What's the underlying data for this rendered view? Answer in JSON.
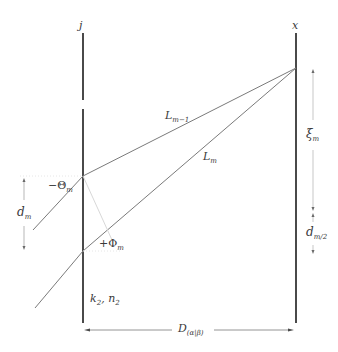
{
  "diagram": {
    "colors": {
      "boundary": "#4a4a4a",
      "ray": "#7a7a7a",
      "dimension": "#9a9a9a",
      "text": "#3a3a3a"
    },
    "boundaries": {
      "left": {
        "label": "j",
        "x": 83
      },
      "right": {
        "label": "x",
        "x": 296
      }
    },
    "rays": [
      {
        "label_main": "L",
        "label_sub": "m−1"
      },
      {
        "label_main": "L",
        "label_sub": "m"
      }
    ],
    "angles": {
      "theta": {
        "main": "−Θ",
        "sub": "m"
      },
      "phi": {
        "main": "+Φ",
        "sub": "m"
      }
    },
    "dimensions": {
      "d_m": {
        "main": "d",
        "sub": "m"
      },
      "xi_m": {
        "main": "ξ",
        "sub": "m"
      },
      "d_m2": {
        "main": "d",
        "sub": "m/2"
      },
      "D": {
        "main": "D",
        "sub": "(α|β)"
      }
    },
    "medium": {
      "k": "k",
      "k_sub": "2",
      "n": "n",
      "n_sub": "2",
      "sep": ", "
    }
  }
}
